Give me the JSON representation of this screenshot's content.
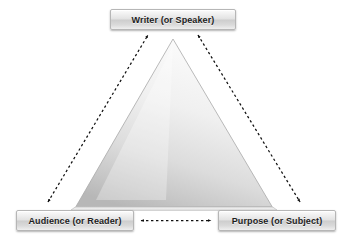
{
  "diagram": {
    "background_color": "#ffffff",
    "nodes": [
      {
        "id": "writer",
        "label": "Writer (or Speaker)",
        "position": "top"
      },
      {
        "id": "audience",
        "label": "Audience (or Reader)",
        "position": "bottom-left"
      },
      {
        "id": "purpose",
        "label": "Purpose (or Subject)",
        "position": "bottom-right"
      }
    ],
    "connectors": [
      {
        "id": "audience-writer",
        "from": "audience",
        "to": "writer",
        "style": "dashed",
        "arrowheads": "both"
      },
      {
        "id": "writer-purpose",
        "from": "writer",
        "to": "purpose",
        "style": "dashed",
        "arrowheads": "both"
      },
      {
        "id": "audience-purpose",
        "from": "audience",
        "to": "purpose",
        "style": "dashed",
        "arrowheads": "both"
      }
    ],
    "shape": {
      "id": "triangle",
      "kind": "triangle",
      "fill_top": "#fbfbfb",
      "fill_bottom": "#bcbcbc",
      "stroke": "#9a9a9a"
    },
    "colors": {
      "line": "#1a1a1a",
      "box_border": "#b6b6b6",
      "text": "#1d1d1d"
    }
  }
}
